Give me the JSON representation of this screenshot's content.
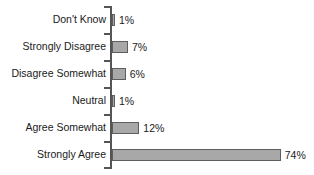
{
  "chart_data": {
    "type": "bar",
    "orientation": "horizontal",
    "title": "",
    "subtitle": "",
    "xlabel": "",
    "ylabel": "",
    "xlim": [
      0,
      74
    ],
    "grid": false,
    "legend": null,
    "categories": [
      "Don't Know",
      "Strongly Disagree",
      "Disagree Somewhat",
      "Neutral",
      "Agree Somewhat",
      "Strongly Agree"
    ],
    "values": [
      1,
      7,
      6,
      1,
      12,
      74
    ],
    "value_labels": [
      "1%",
      "7%",
      "6%",
      "1%",
      "12%",
      "74%"
    ],
    "bars": [
      {
        "category": "Don't Know",
        "value": 1,
        "label": "1%"
      },
      {
        "category": "Strongly Disagree",
        "value": 7,
        "label": "7%"
      },
      {
        "category": "Disagree Somewhat",
        "value": 6,
        "label": "6%"
      },
      {
        "category": "Neutral",
        "value": 1,
        "label": "1%"
      },
      {
        "category": "Agree Somewhat",
        "value": 12,
        "label": "12%"
      },
      {
        "category": "Strongly Agree",
        "value": 74,
        "label": "74%"
      }
    ],
    "colors": {
      "bar_fill": "#a8a8a8",
      "bar_stroke": "#5e5e5e",
      "axis": "#555555",
      "text": "#1a1a1a",
      "background": "#ffffff"
    }
  }
}
